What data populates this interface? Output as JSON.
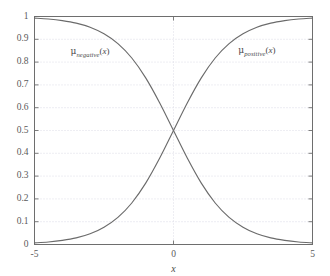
{
  "chart_data": {
    "type": "line",
    "title": "",
    "subtitle": "",
    "xlabel": "x",
    "ylabel": "",
    "xlim": [
      -5,
      5
    ],
    "ylim": [
      0,
      1
    ],
    "grid": true,
    "grid_style": "dotted",
    "legend_position": "inline-annotations",
    "background_color": "#ffffff",
    "frame_color": "#6e6e6e",
    "grid_color": "#d8d8e4",
    "curve_color": "#6b6b6b",
    "xticks": [
      -5,
      0,
      5
    ],
    "xtick_labels": [
      "-5",
      "0",
      "5"
    ],
    "yticks": [
      0,
      0.1,
      0.2,
      0.3,
      0.4,
      0.5,
      0.6,
      0.7,
      0.8,
      0.9,
      1
    ],
    "ytick_labels": [
      "0",
      "0.1",
      "0.2",
      "0.3",
      "0.4",
      "0.5",
      "0.6",
      "0.7",
      "0.8",
      "0.9",
      "1"
    ],
    "x": [
      -5,
      -4.5,
      -4,
      -3.5,
      -3,
      -2.5,
      -2,
      -1.5,
      -1,
      -0.5,
      0,
      0.5,
      1,
      1.5,
      2,
      2.5,
      3,
      3.5,
      4,
      4.5,
      5
    ],
    "series": [
      {
        "name": "mu_negative",
        "label_text": "μ_negative(x)",
        "color": "#6b6b6b",
        "values": [
          0.993,
          0.989,
          0.982,
          0.971,
          0.953,
          0.924,
          0.881,
          0.818,
          0.731,
          0.622,
          0.5,
          0.378,
          0.269,
          0.182,
          0.119,
          0.076,
          0.047,
          0.029,
          0.018,
          0.011,
          0.007
        ]
      },
      {
        "name": "mu_positive",
        "label_text": "μ_positive(x)",
        "color": "#6b6b6b",
        "values": [
          0.007,
          0.011,
          0.018,
          0.029,
          0.047,
          0.076,
          0.119,
          0.182,
          0.269,
          0.378,
          0.5,
          0.622,
          0.731,
          0.818,
          0.881,
          0.924,
          0.953,
          0.971,
          0.982,
          0.989,
          0.993
        ]
      }
    ],
    "annotations": [
      {
        "name": "mu-negative-label",
        "mu": "μ",
        "subscript": "negative",
        "open_paren": "(",
        "variable": "x",
        "close_paren": ")",
        "x": -3.0,
        "y": 0.84
      },
      {
        "name": "mu-positive-label",
        "mu": "μ",
        "subscript": "positive",
        "open_paren": "(",
        "variable": "x",
        "close_paren": ")",
        "x": 3.0,
        "y": 0.845
      }
    ]
  }
}
